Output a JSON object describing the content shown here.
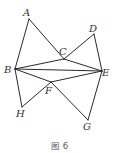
{
  "figure": {
    "caption": "图 6",
    "line_color": "#2a2a2a",
    "points": {
      "A": {
        "x": 29,
        "y": 19,
        "label": "A",
        "lx": 23,
        "ly": 16
      },
      "B": {
        "x": 15,
        "y": 69,
        "label": "B",
        "lx": 4,
        "ly": 73
      },
      "C": {
        "x": 64,
        "y": 59,
        "label": "C",
        "lx": 59,
        "ly": 55
      },
      "D": {
        "x": 94,
        "y": 34,
        "label": "D",
        "lx": 89,
        "ly": 32
      },
      "E": {
        "x": 102,
        "y": 71,
        "label": "E",
        "lx": 102,
        "ly": 76
      },
      "F": {
        "x": 51,
        "y": 82,
        "label": "F",
        "lx": 45,
        "ly": 94
      },
      "G": {
        "x": 88,
        "y": 120,
        "label": "G",
        "lx": 83,
        "ly": 130
      },
      "H": {
        "x": 22,
        "y": 107,
        "label": "H",
        "lx": 16,
        "ly": 117
      }
    },
    "segments": [
      [
        "A",
        "B"
      ],
      [
        "A",
        "C"
      ],
      [
        "C",
        "E"
      ],
      [
        "C",
        "D"
      ],
      [
        "D",
        "E"
      ],
      [
        "B",
        "C"
      ],
      [
        "B",
        "E"
      ],
      [
        "B",
        "F"
      ],
      [
        "F",
        "E"
      ],
      [
        "B",
        "H"
      ],
      [
        "H",
        "F"
      ],
      [
        "F",
        "G"
      ],
      [
        "G",
        "E"
      ]
    ]
  }
}
